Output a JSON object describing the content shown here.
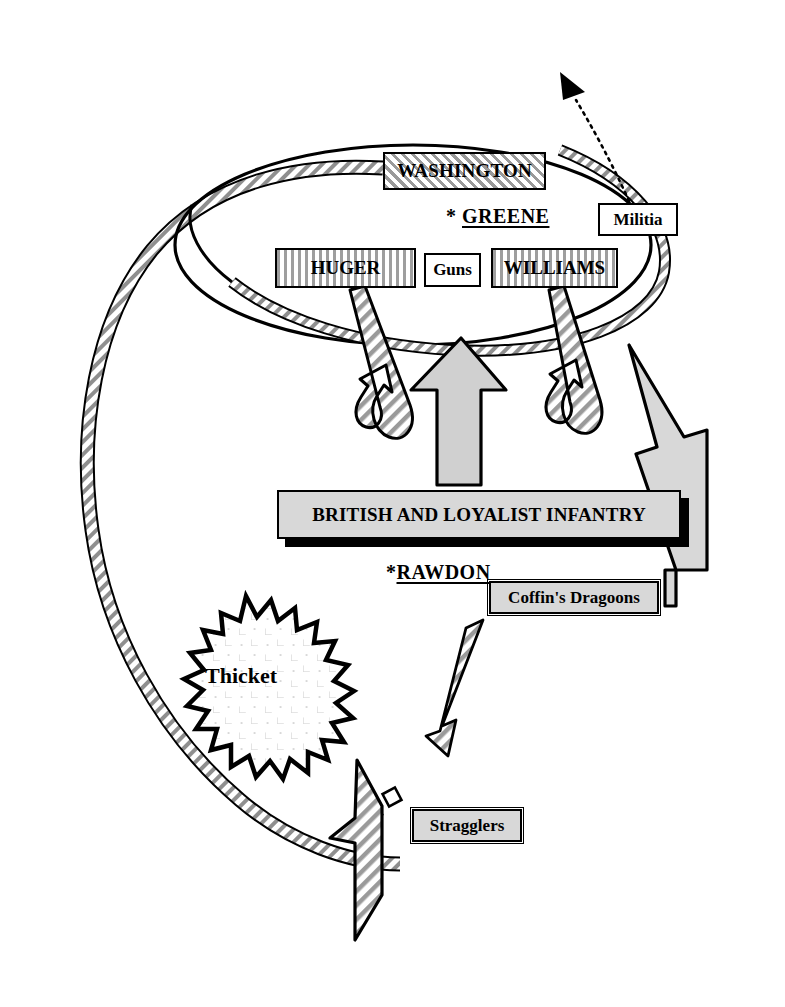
{
  "map": {
    "title": "Battle of Hobkirk's Hill tactical map",
    "width": 785,
    "height": 1007,
    "background_color": "#ffffff",
    "line_color": "#000000",
    "fill_gray": "#d8d8d8",
    "hatch_gray": "#9a9a9a"
  },
  "american": {
    "commander": {
      "marker": "*",
      "name": "GREENE",
      "full_label": "* GREENE"
    },
    "units": [
      {
        "key": "washington",
        "label": "WASHINGTON",
        "fill": "diagonal-hatch"
      },
      {
        "key": "militia",
        "label": "Militia",
        "fill": "white"
      },
      {
        "key": "huger",
        "label": "HUGER",
        "fill": "vertical-hatch"
      },
      {
        "key": "guns",
        "label": "Guns",
        "fill": "white"
      },
      {
        "key": "williams",
        "label": "WILLIAMS",
        "fill": "vertical-hatch"
      }
    ]
  },
  "british": {
    "commander": {
      "marker": "*",
      "name": "RAWDON",
      "full_label": "*RAWDON"
    },
    "units": [
      {
        "key": "infantry",
        "label": "BRITISH AND LOYALIST INFANTRY",
        "fill": "solid-gray"
      },
      {
        "key": "coffin",
        "label": "Coffin's Dragoons",
        "fill": "solid-gray"
      },
      {
        "key": "stragglers",
        "label": "Stragglers",
        "fill": "solid-gray"
      }
    ]
  },
  "terrain": [
    {
      "key": "thicket",
      "label": "Thicket",
      "shape": "starburst",
      "fill": "scattered-shrub-dots"
    },
    {
      "key": "road",
      "label": "",
      "shape": "curved-band",
      "fill": "diagonal-hatch"
    }
  ],
  "movements": [
    {
      "key": "militia-rout",
      "style": "dotted-line-solid-head",
      "from": "militia",
      "direction": "up-left"
    },
    {
      "key": "huger-retreat",
      "style": "hooked-outline-arrow",
      "from": "huger",
      "direction": "down-then-back"
    },
    {
      "key": "williams-retreat",
      "style": "hooked-outline-arrow",
      "from": "williams",
      "direction": "down-then-back"
    },
    {
      "key": "infantry-advance",
      "style": "solid-gray-arrow",
      "from": "infantry",
      "direction": "up"
    },
    {
      "key": "coffin-flank",
      "style": "bent-gray-arrow",
      "from": "coffin",
      "direction": "up-left"
    },
    {
      "key": "stragglers-advance",
      "style": "segmented-hatch-arrow",
      "from": "stragglers",
      "direction": "up-right"
    },
    {
      "key": "road-arrow",
      "style": "hatched-pennant-arrow",
      "from": "road",
      "direction": "up"
    }
  ]
}
